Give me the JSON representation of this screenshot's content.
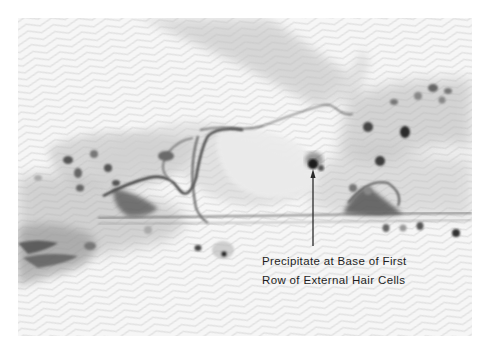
{
  "figure": {
    "type": "grayscale micrograph",
    "background_color": "#ffffff",
    "photo_tone": "#f4f4f4",
    "annotation": {
      "arrow": {
        "target": "dark precipitate",
        "tip_x": 313,
        "tip_y": 178,
        "tail_x": 313,
        "tail_y": 246,
        "color": "#2a2a2a"
      },
      "caption_lines": [
        "Precipitate at Base of First",
        "Row of External Hair Cells"
      ]
    }
  }
}
